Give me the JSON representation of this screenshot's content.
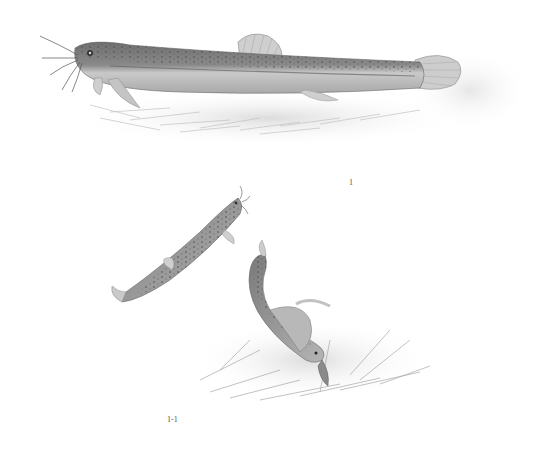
{
  "plate": {
    "subject": "loach fish illustration",
    "figures": [
      {
        "id": "fig-1",
        "label": "1",
        "description": "adult loach lying on aquatic vegetation, lateral view"
      },
      {
        "id": "fig-1-1",
        "label": "1-1",
        "description": "loach swimming upward and loach burrowing/coiled among vegetation"
      }
    ]
  },
  "colors": {
    "background": "#ffffff",
    "body_dark": "#6a6a6a",
    "body_light": "#c8c8c8",
    "spots": "#4a4a4a",
    "vegetation": "#bdbdbd"
  }
}
